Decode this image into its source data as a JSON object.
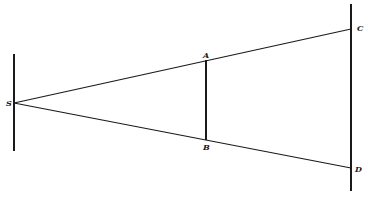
{
  "diagram": {
    "labels": {
      "S": "S",
      "A": "A",
      "B": "B",
      "C": "C",
      "D": "D"
    },
    "line_color": "#1a1a1a",
    "background": "#ffffff"
  }
}
